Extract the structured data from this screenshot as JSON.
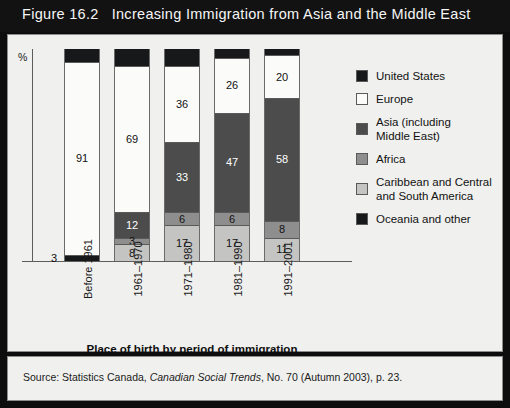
{
  "title": {
    "figure_number": "Figure 16.2",
    "text": "Increasing Immigration from Asia and the Middle East"
  },
  "axis": {
    "y_unit_label": "%",
    "x_title": "Place of birth by period of immigration"
  },
  "source": {
    "prefix": "Source: Statistics Canada,",
    "italic": "Canadian Social Trends",
    "suffix": ", No. 70 (Autumn 2003), p. 23."
  },
  "legend": {
    "items": [
      {
        "label": "United States",
        "color": "#17181a",
        "two_line": false
      },
      {
        "label": "Europe",
        "color": "#fbfbfa",
        "two_line": false
      },
      {
        "label": "Asia (including\nMiddle East)",
        "color": "#4c4c4c",
        "two_line": true
      },
      {
        "label": "Africa",
        "color": "#8e8e8e",
        "two_line": false
      },
      {
        "label": "Caribbean and Central\nand South America",
        "color": "#c4c4c2",
        "two_line": true
      },
      {
        "label": "Oceania and other",
        "color": "#17181a",
        "two_line": false
      }
    ]
  },
  "chart_data": {
    "type": "bar",
    "subtype": "stacked-percentage",
    "title": "Increasing Immigration from Asia and the Middle East",
    "xlabel": "Place of birth by period of immigration",
    "ylabel": "%",
    "ylim": [
      0,
      100
    ],
    "grid": false,
    "legend_position": "right",
    "categories": [
      "Before 1961",
      "1961–1970",
      "1971–1980",
      "1981–1990",
      "1991–2001"
    ],
    "series": [
      {
        "name": "United States",
        "color": "#17181a",
        "values": [
          3,
          null,
          null,
          null,
          null
        ]
      },
      {
        "name": "Europe",
        "color": "#fbfbfa",
        "values": [
          91,
          69,
          36,
          26,
          20
        ]
      },
      {
        "name": "Asia (including Middle East)",
        "color": "#4c4c4c",
        "values": [
          null,
          12,
          33,
          47,
          58
        ]
      },
      {
        "name": "Africa",
        "color": "#8e8e8e",
        "values": [
          null,
          3,
          6,
          6,
          8
        ]
      },
      {
        "name": "Caribbean and Central and South America",
        "color": "#c4c4c2",
        "values": [
          null,
          8,
          17,
          17,
          11
        ]
      },
      {
        "name": "Oceania and other",
        "color": "#17181a",
        "values": [
          6,
          8,
          8,
          4,
          3
        ]
      }
    ],
    "bars": [
      {
        "category": "Before 1961",
        "segments": [
          {
            "series": "Oceania and other",
            "value": 6,
            "label": "",
            "color": "#17181a"
          },
          {
            "series": "Europe",
            "value": 91,
            "label": "91",
            "color": "#fbfbfa"
          },
          {
            "series": "United States",
            "value": 3,
            "label": "3",
            "color": "#17181a",
            "label_outside": true
          }
        ]
      },
      {
        "category": "1961–1970",
        "segments": [
          {
            "series": "Oceania and other",
            "value": 8,
            "label": "",
            "color": "#17181a"
          },
          {
            "series": "Europe",
            "value": 69,
            "label": "69",
            "color": "#fbfbfa"
          },
          {
            "series": "Asia (including Middle East)",
            "value": 12,
            "label": "12",
            "color": "#4c4c4c"
          },
          {
            "series": "Africa",
            "value": 3,
            "label": "3",
            "color": "#8e8e8e"
          },
          {
            "series": "Caribbean and Central and South America",
            "value": 8,
            "label": "8",
            "color": "#c4c4c2"
          }
        ]
      },
      {
        "category": "1971–1980",
        "segments": [
          {
            "series": "Oceania and other",
            "value": 8,
            "label": "",
            "color": "#17181a"
          },
          {
            "series": "Europe",
            "value": 36,
            "label": "36",
            "color": "#fbfbfa"
          },
          {
            "series": "Asia (including Middle East)",
            "value": 33,
            "label": "33",
            "color": "#4c4c4c"
          },
          {
            "series": "Africa",
            "value": 6,
            "label": "6",
            "color": "#8e8e8e"
          },
          {
            "series": "Caribbean and Central and South America",
            "value": 17,
            "label": "17",
            "color": "#c4c4c2"
          }
        ]
      },
      {
        "category": "1981–1990",
        "segments": [
          {
            "series": "Oceania and other",
            "value": 4,
            "label": "",
            "color": "#17181a"
          },
          {
            "series": "Europe",
            "value": 26,
            "label": "26",
            "color": "#fbfbfa"
          },
          {
            "series": "Asia (including Middle East)",
            "value": 47,
            "label": "47",
            "color": "#4c4c4c"
          },
          {
            "series": "Africa",
            "value": 6,
            "label": "6",
            "color": "#8e8e8e"
          },
          {
            "series": "Caribbean and Central and South America",
            "value": 17,
            "label": "17",
            "color": "#c4c4c2"
          }
        ]
      },
      {
        "category": "1991–2001",
        "segments": [
          {
            "series": "Oceania and other",
            "value": 3,
            "label": "",
            "color": "#17181a"
          },
          {
            "series": "Europe",
            "value": 20,
            "label": "20",
            "color": "#fbfbfa"
          },
          {
            "series": "Asia (including Middle East)",
            "value": 58,
            "label": "58",
            "color": "#4c4c4c"
          },
          {
            "series": "Africa",
            "value": 8,
            "label": "8",
            "color": "#8e8e8e"
          },
          {
            "series": "Caribbean and Central and South America",
            "value": 11,
            "label": "11",
            "color": "#c4c4c2"
          }
        ]
      }
    ]
  }
}
